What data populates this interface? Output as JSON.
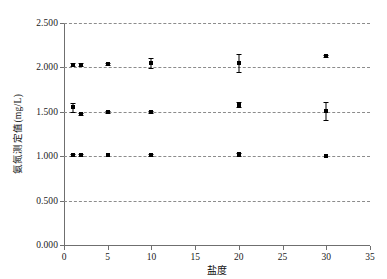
{
  "chart_data": {
    "type": "scatter",
    "title": "",
    "xlabel": "盐度",
    "ylabel": "氨氮测定值(mg/L)",
    "xlim": [
      0,
      35
    ],
    "ylim": [
      0.0,
      2.5
    ],
    "xticks": [
      0,
      5,
      10,
      15,
      20,
      25,
      30,
      35
    ],
    "xtick_labels": [
      "0",
      "5",
      "10",
      "15",
      "20",
      "25",
      "30",
      "35"
    ],
    "yticks": [
      0.0,
      0.5,
      1.0,
      1.5,
      2.0,
      2.5
    ],
    "ytick_labels": [
      "0.000",
      "0.500",
      "1.000",
      "1.500",
      "2.000",
      "2.500"
    ],
    "grid": "horizontal-dashed",
    "legend": "none",
    "marker": "filled-square",
    "marker_color": "#000000",
    "x": [
      1,
      2,
      5,
      10,
      20,
      30
    ],
    "series": [
      {
        "name": "1.000 mg/L 标准组",
        "values": [
          1.012,
          1.01,
          1.008,
          1.01,
          1.02,
          1.005
        ],
        "errors": [
          0.012,
          0.01,
          0.008,
          0.01,
          0.015,
          0.008
        ]
      },
      {
        "name": "1.500 mg/L 标准组",
        "values": [
          1.55,
          1.48,
          1.5,
          1.5,
          1.58,
          1.51
        ],
        "errors": [
          0.05,
          0.012,
          0.01,
          0.012,
          0.028,
          0.105
        ]
      },
      {
        "name": "2.000 mg/L 标准组",
        "values": [
          2.03,
          2.03,
          2.04,
          2.05,
          2.05,
          2.13
        ],
        "errors": [
          0.015,
          0.015,
          0.012,
          0.06,
          0.105,
          0.012
        ]
      }
    ]
  }
}
